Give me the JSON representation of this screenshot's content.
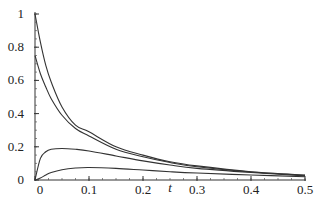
{
  "chart_data": {
    "type": "line",
    "title": "",
    "xlabel": "t",
    "ylabel": "",
    "xlim": [
      0,
      0.5
    ],
    "ylim": [
      0,
      1
    ],
    "grid": false,
    "legend": null,
    "x_ticks": [
      0,
      0.1,
      0.2,
      0.3,
      0.4,
      0.5
    ],
    "x_tick_labels": [
      "0",
      "0.1",
      "0.2",
      "0.3",
      "0.4",
      "0.5"
    ],
    "y_ticks": [
      0,
      0.2,
      0.4,
      0.6,
      0.8,
      1
    ],
    "y_tick_labels": [
      "0",
      "0.2",
      "0.4",
      "0.6",
      "0.8",
      "1"
    ],
    "x": [
      0,
      0.01,
      0.02,
      0.03,
      0.05,
      0.075,
      0.1,
      0.15,
      0.2,
      0.25,
      0.3,
      0.4,
      0.5
    ],
    "series": [
      {
        "name": "curve-1",
        "values": [
          1.0,
          0.83,
          0.69,
          0.59,
          0.44,
          0.33,
          0.29,
          0.2,
          0.15,
          0.11,
          0.085,
          0.05,
          0.03
        ]
      },
      {
        "name": "curve-2",
        "values": [
          0.75,
          0.64,
          0.56,
          0.49,
          0.39,
          0.31,
          0.265,
          0.185,
          0.14,
          0.105,
          0.08,
          0.048,
          0.028
        ]
      },
      {
        "name": "curve-3",
        "values": [
          0.0,
          0.13,
          0.17,
          0.185,
          0.19,
          0.185,
          0.175,
          0.145,
          0.115,
          0.09,
          0.07,
          0.045,
          0.025
        ]
      },
      {
        "name": "curve-4",
        "values": [
          0.0,
          0.012,
          0.03,
          0.045,
          0.062,
          0.072,
          0.075,
          0.07,
          0.06,
          0.05,
          0.042,
          0.03,
          0.02
        ]
      }
    ],
    "line_color": "#333333"
  }
}
